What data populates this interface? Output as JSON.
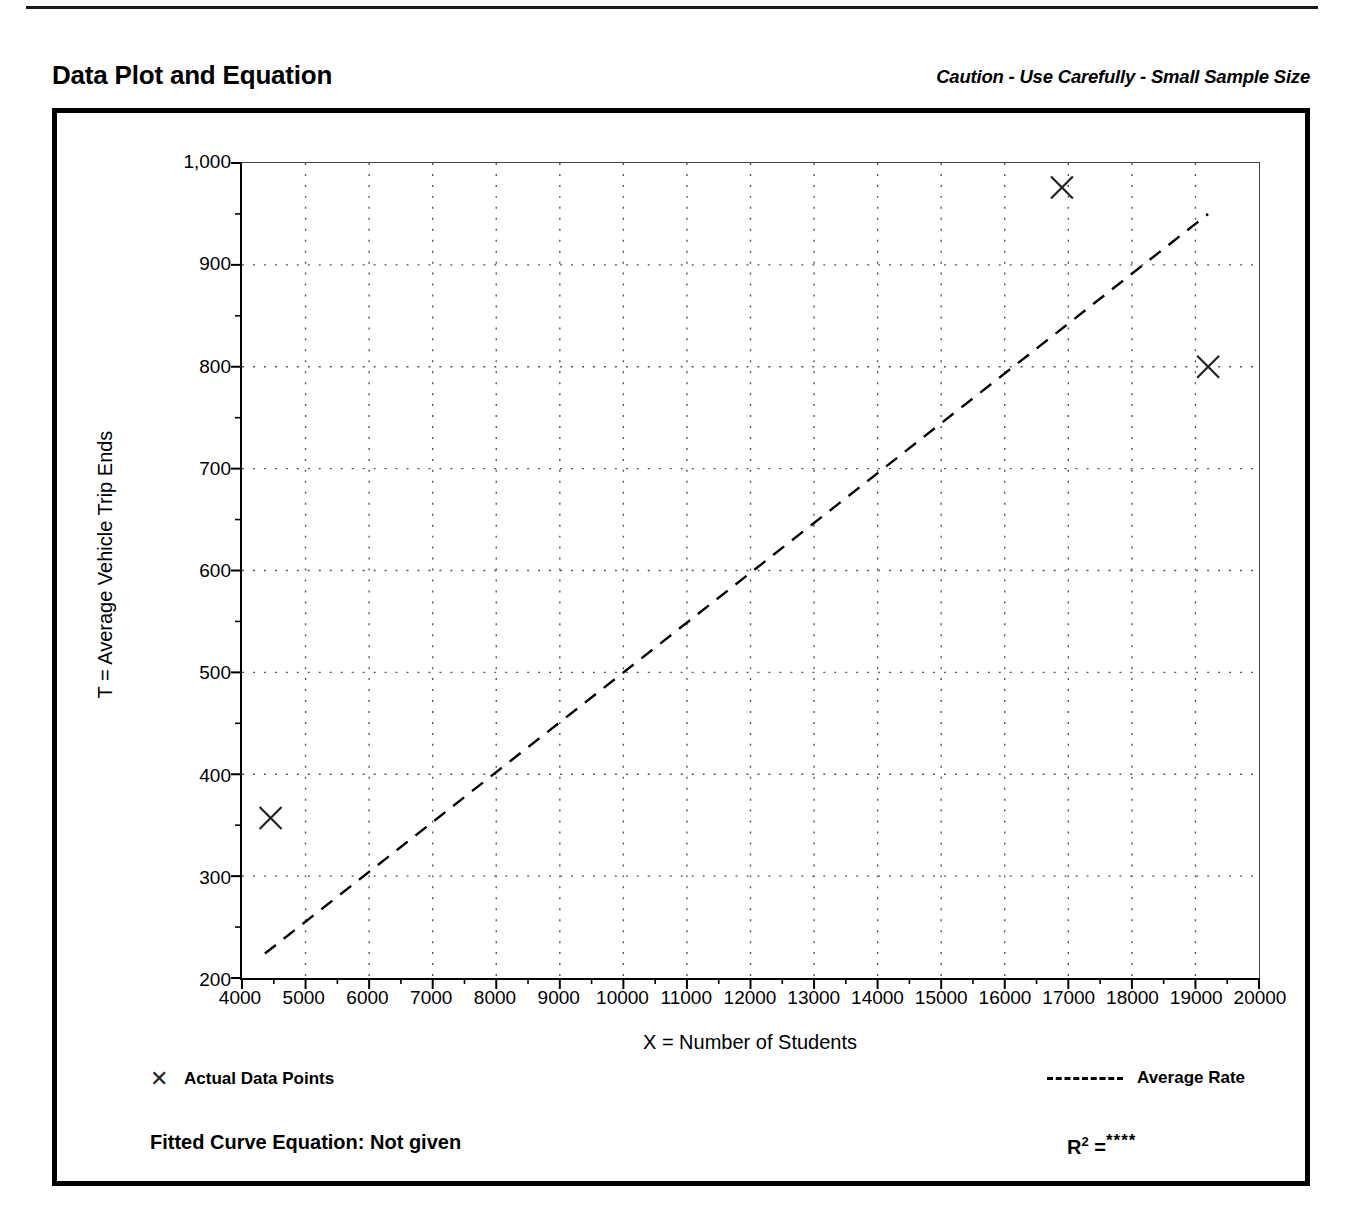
{
  "page": {
    "title": "Data Plot and Equation",
    "caution": "Caution - Use Carefully - Small Sample Size"
  },
  "legend": {
    "points_label": "Actual Data Points",
    "points_marker": "x-marker-icon",
    "rate_label": "Average Rate",
    "rate_marker": "dashed-line-icon"
  },
  "footer": {
    "equation_label": "Fitted Curve Equation:  Not given",
    "r2_prefix": "R",
    "r2_exponent": "2",
    "r2_equals": "=",
    "r2_value": "****"
  },
  "chart_data": {
    "type": "scatter",
    "title": "Data Plot and Equation",
    "xlabel": "X = Number of Students",
    "ylabel": "T = Average Vehicle Trip Ends",
    "xlim": [
      4000,
      20000
    ],
    "ylim": [
      200,
      1000
    ],
    "xticks": [
      4000,
      5000,
      6000,
      7000,
      8000,
      9000,
      10000,
      11000,
      12000,
      13000,
      14000,
      15000,
      16000,
      17000,
      18000,
      19000,
      20000
    ],
    "xticklabels": [
      "4000",
      "5000",
      "6000",
      "7000",
      "8000",
      "9000",
      "10000",
      "11000",
      "12000",
      "13000",
      "14000",
      "15000",
      "16000",
      "17000",
      "18000",
      "19000",
      "20000"
    ],
    "yticks": [
      200,
      300,
      400,
      500,
      600,
      700,
      800,
      900,
      1000
    ],
    "yticklabels": [
      "200",
      "300",
      "400",
      "500",
      "600",
      "700",
      "800",
      "900",
      "1,000"
    ],
    "y_minor_ticks": [
      250,
      350,
      450,
      550,
      650,
      750,
      850,
      950
    ],
    "grid": "dotted-vertical-and-horizontal",
    "legend_position": "below-axes",
    "series": [
      {
        "name": "Actual Data Points",
        "type": "scatter",
        "marker": "x",
        "points": [
          {
            "x": 4450,
            "y": 357
          },
          {
            "x": 16900,
            "y": 976
          },
          {
            "x": 19200,
            "y": 800
          }
        ]
      },
      {
        "name": "Average Rate",
        "type": "line",
        "style": "dashed",
        "points": [
          {
            "x": 4360,
            "y": 224
          },
          {
            "x": 19200,
            "y": 950
          }
        ]
      }
    ]
  }
}
